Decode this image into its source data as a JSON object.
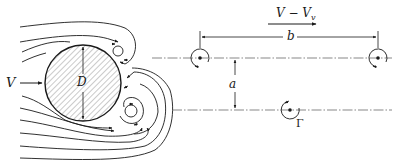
{
  "figure": {
    "colors": {
      "ink": "#1a1a1a",
      "hatch": "#7a7a7a",
      "background": "#ffffff"
    }
  },
  "labels": {
    "freestream_velocity": "V",
    "cylinder_diameter": "D",
    "vortex_street_velocity_main": "V − V",
    "vortex_street_velocity_sub": "v",
    "vortex_spacing": "b",
    "row_spacing": "a",
    "circulation": "Γ"
  },
  "elements": {
    "cylinder": {
      "cx": 83,
      "cy": 83,
      "r": 38,
      "fill": "hatched"
    },
    "vortex_rows": [
      {
        "y": 58,
        "vortices_x": [
          200,
          378
        ],
        "rotation": "clockwise"
      },
      {
        "y": 110,
        "vortices_x": [
          290
        ],
        "rotation": "counterclockwise"
      }
    ],
    "dimensions": {
      "b": {
        "from_x": 200,
        "to_x": 378,
        "y": 37
      },
      "a": {
        "x": 235,
        "from_y": 58,
        "to_y": 110
      }
    }
  }
}
